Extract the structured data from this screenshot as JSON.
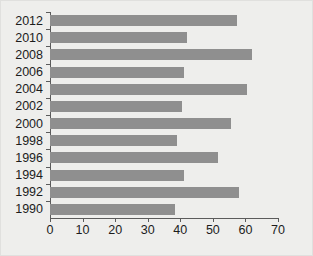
{
  "chart_data": {
    "type": "bar",
    "orientation": "horizontal",
    "title": "",
    "subtitle": "",
    "xlabel": "",
    "ylabel": "",
    "categories": [
      "2012",
      "2010",
      "2008",
      "2006",
      "2004",
      "2002",
      "2000",
      "1998",
      "1996",
      "1994",
      "1992",
      "1990"
    ],
    "values": [
      57.5,
      42,
      62,
      41,
      60.5,
      40.5,
      55.5,
      39,
      51.5,
      41,
      58,
      38.5
    ],
    "series": [
      {
        "name": "",
        "values": [
          57.5,
          42,
          62,
          41,
          60.5,
          40.5,
          55.5,
          39,
          51.5,
          41,
          58,
          38.5
        ]
      }
    ],
    "xlim": [
      0,
      70
    ],
    "ylim": null,
    "xticks": [
      0,
      10,
      20,
      30,
      40,
      50,
      60,
      70
    ],
    "xticklabels": [
      "0",
      "10",
      "20",
      "30",
      "40",
      "50",
      "60",
      "70"
    ],
    "yticklabels": [
      "2012",
      "2010",
      "2008",
      "2006",
      "2004",
      "2002",
      "2000",
      "1998",
      "1996",
      "1994",
      "1992",
      "1990"
    ],
    "grid": false,
    "legend": null,
    "legend_position": "none",
    "annotations": [],
    "colors": {
      "bar": "#8f8f8f",
      "axis": "#5b5b5b",
      "text": "#1c1c1c",
      "background": "#eeeeec"
    }
  }
}
